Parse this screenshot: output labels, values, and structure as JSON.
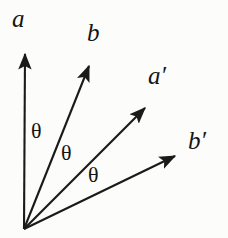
{
  "figure": {
    "background_color": "#fcfcfa",
    "stroke_color": "#1a1a1a",
    "text_color": "#151515",
    "origin": {
      "x": 24,
      "y": 229
    }
  },
  "vectors": [
    {
      "id": "a",
      "label": "a",
      "tip": {
        "x": 25,
        "y": 48
      },
      "label_pos": {
        "x": 12,
        "y": 6
      }
    },
    {
      "id": "b",
      "label": "b",
      "tip": {
        "x": 92,
        "y": 60
      },
      "label_pos": {
        "x": 87,
        "y": 20
      }
    },
    {
      "id": "a-prime",
      "label": "a",
      "prime": "′",
      "tip": {
        "x": 150,
        "y": 102
      },
      "label_pos": {
        "x": 148,
        "y": 63
      }
    },
    {
      "id": "b-prime",
      "label": "b",
      "prime": "′",
      "tip": {
        "x": 181,
        "y": 153
      },
      "label_pos": {
        "x": 188,
        "y": 128
      }
    }
  ],
  "angles": [
    {
      "id": "theta-a-b",
      "label": "θ",
      "pos": {
        "x": 31,
        "y": 120
      }
    },
    {
      "id": "theta-b-aprime",
      "label": "θ",
      "pos": {
        "x": 61,
        "y": 142
      }
    },
    {
      "id": "theta-aprime-bprime",
      "label": "θ",
      "pos": {
        "x": 88,
        "y": 164
      }
    }
  ]
}
